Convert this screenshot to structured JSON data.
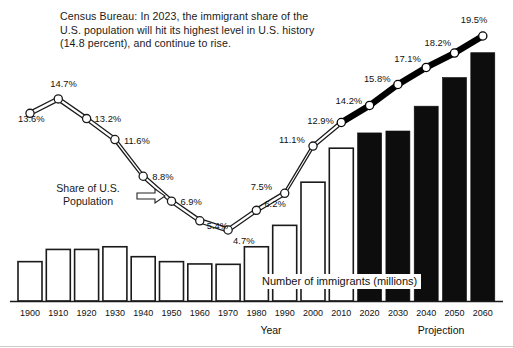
{
  "chart_data": {
    "type": "bar",
    "title": "",
    "xlabel": "Year",
    "ylabel": "",
    "grid": false,
    "legend_position": "none",
    "categories": [
      "1900",
      "1910",
      "1920",
      "1930",
      "1940",
      "1950",
      "1960",
      "1970",
      "1980",
      "1990",
      "2000",
      "2010",
      "2020",
      "2030",
      "2040",
      "2050",
      "2060"
    ],
    "series": [
      {
        "name": "Number of immigrants (millions)",
        "type": "bar",
        "note": "Bar heights read off pixels; axis unlabeled. Values are relative bar magnitudes.",
        "values": [
          10.3,
          13.5,
          13.5,
          14.2,
          11.6,
          10.3,
          9.7,
          9.6,
          14.2,
          19.8,
          31.1,
          40.0,
          44.0,
          44.5,
          51.0,
          58.5,
          65.0
        ],
        "fill": [
          "white",
          "white",
          "white",
          "white",
          "white",
          "white",
          "white",
          "white",
          "white",
          "white",
          "white",
          "white",
          "black",
          "black",
          "black",
          "black",
          "black"
        ]
      },
      {
        "name": "Share of U.S. Population",
        "type": "line",
        "values": [
          13.6,
          14.7,
          13.2,
          11.6,
          8.8,
          6.9,
          5.4,
          4.7,
          6.2,
          7.5,
          11.1,
          12.9,
          14.2,
          15.8,
          17.1,
          18.2,
          19.5
        ],
        "labels": [
          "13.6%",
          "14.7%",
          "13.2%",
          "11.6%",
          "8.8%",
          "6.9%",
          "5.4%",
          "4.7%",
          "6.2%",
          "7.5%",
          "11.1%",
          "12.9%",
          "14.2%",
          "15.8%",
          "17.1%",
          "18.2%",
          "19.5%"
        ],
        "projection_starts_at": "2010"
      }
    ],
    "annotations": [
      {
        "name": "census-note",
        "text": "Census Bureau: In 2023, the immigrant share of the\nU.S. population will hit its highest level in U.S. history\n(14.8 percent), and continue to rise."
      },
      {
        "name": "share-arrow-label",
        "text": "Share of U.S.\nPopulation"
      },
      {
        "name": "bars-label",
        "text": "Number of immigrants (millions)"
      },
      {
        "name": "projection-label",
        "text": "Projection"
      }
    ],
    "colors": {
      "line_historic": "#1a1a1a",
      "line_projection": "#000000",
      "bar_historic_fill": "#ffffff",
      "bar_projection_fill": "#0d0d0d",
      "bar_stroke": "#1a1a1a",
      "text": "#111111",
      "background": "#ffffff"
    }
  },
  "labels": {
    "year_axis_title": "Year",
    "projection_title": "Projection"
  }
}
